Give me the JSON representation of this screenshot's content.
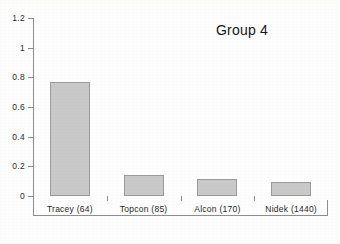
{
  "chart_data": {
    "type": "bar",
    "title": "Group 4",
    "xlabel": "",
    "ylabel": "",
    "categories": [
      "Tracey (64)",
      "Topcon (85)",
      "Alcon (170)",
      "Nidek (1440)"
    ],
    "values": [
      0.77,
      0.14,
      0.115,
      0.095
    ],
    "ylim": [
      0,
      1.2
    ],
    "ytick_labels": [
      "0",
      "0.2",
      "0.4",
      "0.6",
      "0.8",
      "1",
      "1.2"
    ],
    "ytick_values": [
      0,
      0.2,
      0.4,
      0.6,
      0.8,
      1,
      1.2
    ],
    "grid": false,
    "legend": false,
    "bar_color": "#c9c9c9",
    "bar_border_color": "#9a9a9a",
    "axis_color": "#8e8e8e",
    "text_color": "#1f1f1f"
  },
  "figure": {
    "border_color": "#5c5c5c",
    "background": "#fefefe"
  }
}
